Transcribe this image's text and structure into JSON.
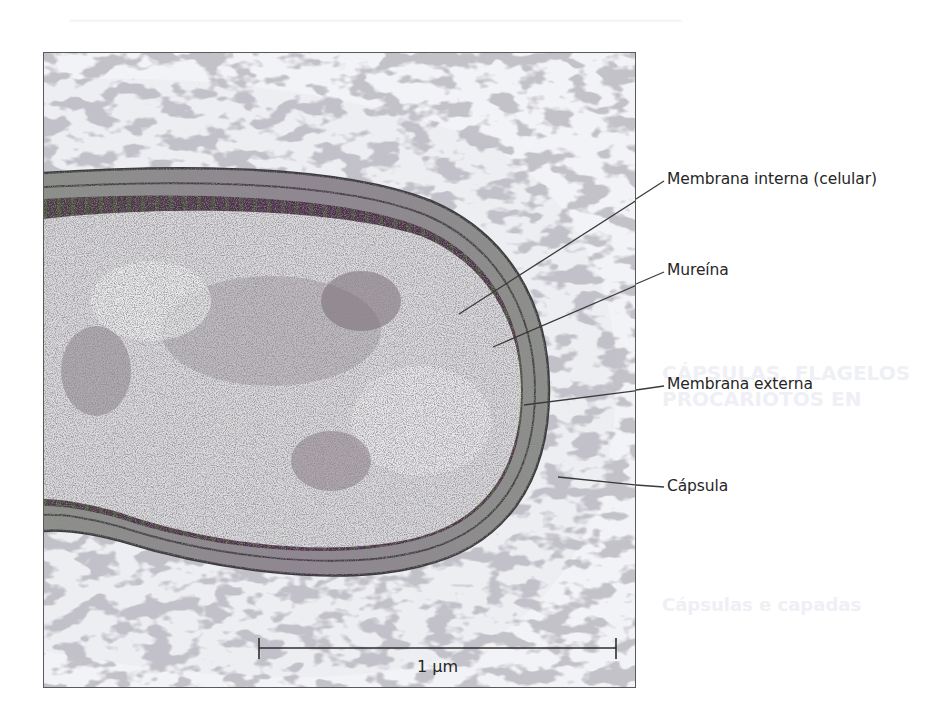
{
  "figure": {
    "labels": [
      {
        "id": "inner-membrane",
        "text": "Membrana interna (celular)"
      },
      {
        "id": "murein",
        "text": "Mureína"
      },
      {
        "id": "outer-membrane",
        "text": "Membrana externa"
      },
      {
        "id": "capsule",
        "text": "Cápsula"
      }
    ],
    "scale_bar": {
      "label": "1 μm"
    }
  },
  "background_page": {
    "headings": [
      "CÁPSULAS, FLAGELOS",
      "PROCARIOTOS EN"
    ],
    "subheading": "Cápsulas e capadas"
  },
  "colors": {
    "frame_border": "#5a5a5a",
    "text": "#262626",
    "cytoplasm_dark": "#4a2f4a",
    "cytoplasm_green": "#4e5a38",
    "capsule_fibers": "#6b6670"
  }
}
